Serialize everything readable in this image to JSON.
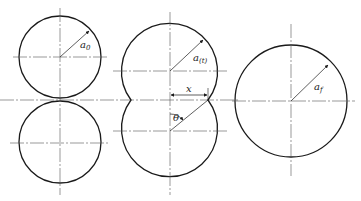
{
  "diagram": {
    "stages": [
      {
        "name": "initial",
        "radius_label": "a",
        "radius_sub": "0"
      },
      {
        "name": "intermediate",
        "radius_label": "a",
        "radius_sub": "(t)",
        "neck_label": "x",
        "angle_label": "θ"
      },
      {
        "name": "final",
        "radius_label": "a",
        "radius_sub": "f"
      }
    ],
    "colors": {
      "stroke": "#1a1a1a",
      "centerline": "#555555"
    }
  }
}
